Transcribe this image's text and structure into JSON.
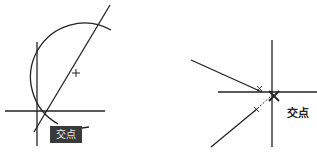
{
  "figure": {
    "left_panel": {
      "tooltip_label": "交点",
      "elements": [
        "circle-arc",
        "vertical-line",
        "horizontal-line",
        "diagonal-line",
        "center-cross",
        "intersection-tooltip"
      ]
    },
    "right_panel": {
      "intersection_label": "交点",
      "elements": [
        "vertical-line",
        "horizontal-line",
        "upper-ray",
        "lower-ray",
        "dashed-extension",
        "intersection-x-marker"
      ]
    },
    "colors": {
      "line": "#222222",
      "tooltip_bg": "#3a3a3a",
      "tooltip_text": "#e8e8e8"
    }
  }
}
